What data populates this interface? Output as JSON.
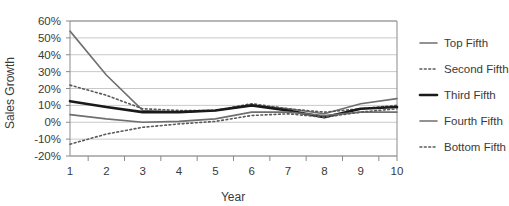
{
  "chart_data": {
    "type": "line",
    "title": "",
    "xlabel": "Year",
    "ylabel": "Sales Growth",
    "categories": [
      1,
      2,
      3,
      4,
      5,
      6,
      7,
      8,
      9,
      10
    ],
    "x_tick_labels": [
      "1",
      "2",
      "3",
      "4",
      "5",
      "6",
      "7",
      "8",
      "9",
      "10"
    ],
    "y_tick_labels": [
      "60%",
      "50%",
      "40%",
      "30%",
      "20%",
      "10%",
      "0%",
      "-10%",
      "-20%"
    ],
    "y_tick_values": [
      60,
      50,
      40,
      30,
      20,
      10,
      0,
      -10,
      -20
    ],
    "ylim": [
      -20,
      60
    ],
    "xlim": [
      1,
      10
    ],
    "grid": "horizontal",
    "legend_position": "right",
    "units": "percent",
    "series": [
      {
        "name": "Top Fifth",
        "style": "solid",
        "color": "#6f6f6f",
        "width": 1.6,
        "values": [
          54,
          28,
          7,
          6,
          7,
          10,
          8,
          5,
          11,
          14
        ]
      },
      {
        "name": "Second Fifth",
        "style": "dotted",
        "color": "#5a5a5a",
        "width": 1.6,
        "values": [
          22,
          16,
          8,
          7,
          7,
          11,
          8,
          6,
          8,
          10
        ]
      },
      {
        "name": "Third Fifth",
        "style": "solid",
        "color": "#1a1a1a",
        "width": 2.6,
        "values": [
          12.5,
          9,
          6,
          6,
          7,
          10,
          7,
          3,
          8,
          9
        ]
      },
      {
        "name": "Fourth Fifth",
        "style": "solid",
        "color": "#6f6f6f",
        "width": 1.6,
        "values": [
          4.5,
          2,
          0,
          0.5,
          2,
          6,
          6,
          4,
          6,
          6
        ]
      },
      {
        "name": "Bottom Fifth",
        "style": "dotted",
        "color": "#5a5a5a",
        "width": 1.6,
        "values": [
          -13,
          -7,
          -3,
          -1,
          0.5,
          4,
          5,
          3,
          6,
          8
        ]
      }
    ]
  },
  "legend": {
    "entries": [
      {
        "label": "Top Fifth"
      },
      {
        "label": "Second Fifth"
      },
      {
        "label": "Third Fifth"
      },
      {
        "label": "Fourth Fifth"
      },
      {
        "label": "Bottom Fifth"
      }
    ]
  },
  "colors": {
    "gray_line": "#6f6f6f",
    "black_line": "#1a1a1a",
    "gridline": "#c9c9c9",
    "axis": "#8a8a8a",
    "text": "#3a3a3a",
    "background": "#ffffff"
  }
}
